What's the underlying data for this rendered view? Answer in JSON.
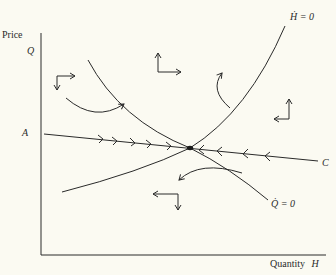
{
  "axes": {
    "y_label": "Price",
    "y_symbol": "Q",
    "x_label": "Quantity",
    "x_symbol": "H"
  },
  "curves": {
    "h_dot_zero": {
      "label": "Ḣ = 0"
    },
    "q_dot_zero": {
      "label": "Q̇ = 0"
    },
    "saddle_path": {
      "start_label": "A",
      "end_label": "C"
    }
  },
  "colors": {
    "ink": "#2a2a2a",
    "background": "#fbfaf2"
  }
}
